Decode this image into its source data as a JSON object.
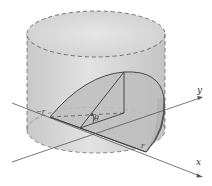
{
  "figure": {
    "labels": {
      "neg_r": "−r",
      "r": "r",
      "theta": "θ",
      "x_axis": "x",
      "y_axis": "y"
    },
    "colors": {
      "cylinder_fill": "#d4d4d4",
      "top_fill": "#dcdcdc",
      "wedge_face": "#bdbdbd",
      "wedge_curved": "#8a8a8a",
      "stroke": "#3a3a3a",
      "dashed": "#555555"
    }
  }
}
